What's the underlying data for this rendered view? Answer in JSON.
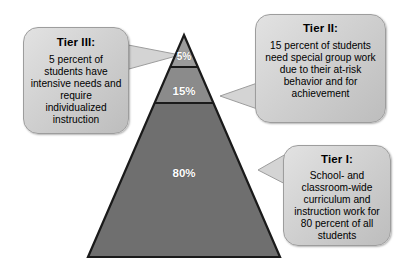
{
  "diagram": {
    "pyramid": {
      "tiers": [
        {
          "id": "tier3",
          "percent_label": "5%",
          "fill": "#9b9b9b"
        },
        {
          "id": "tier2",
          "percent_label": "15%",
          "fill": "#8b8b8b"
        },
        {
          "id": "tier1",
          "percent_label": "80%",
          "fill": "#6f6f6f"
        }
      ],
      "outline_color": "#1a1a1a"
    },
    "callouts": {
      "tier3": {
        "title": "Tier III:",
        "body": "5 percent of students have intensive needs and require individualized instruction"
      },
      "tier2": {
        "title": "Tier II:",
        "body": "15 percent of students need special group work due to their at-risk behavior and for achievement"
      },
      "tier1": {
        "title": "Tier I:",
        "body": "School- and classroom-wide curriculum and instruction work for 80 percent of all students"
      }
    },
    "colors": {
      "callout_fill_light": "#e2e2e2",
      "callout_fill_dark": "#bdbdbd",
      "callout_border": "#9d9d9d",
      "label_text": "#ffffff",
      "background": "#ffffff"
    }
  }
}
